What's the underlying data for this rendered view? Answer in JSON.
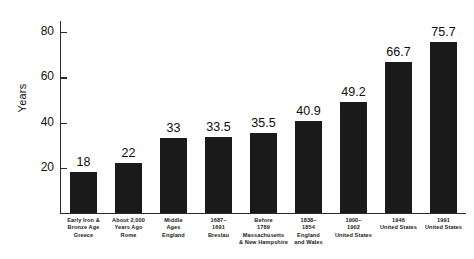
{
  "chart_data": {
    "type": "bar",
    "title": "",
    "subtitle": "",
    "xlabel": "",
    "ylabel": "Years",
    "ylim": [
      0,
      85
    ],
    "grid": false,
    "legend": "none",
    "y_ticks": [
      20,
      40,
      60,
      80
    ],
    "y_tick_labels": [
      "20",
      "40",
      "60",
      "80"
    ],
    "categories": [
      "Early Iron & Bronze Age Greece",
      "About 2,000 Years Ago Rome",
      "Middle Ages England",
      "1687–1691 Breslau",
      "Before 1789 Massachusetts & New Hampshire",
      "1838–1854 England and Wales",
      "1900–1902 United States",
      "1946 United States",
      "1991 United States"
    ],
    "category_lines": [
      [
        "Early Iron &",
        "Bronze Age",
        "Greece"
      ],
      [
        "About 2,000",
        "Years Ago",
        "Rome"
      ],
      [
        "Middle",
        "Ages",
        "England"
      ],
      [
        "1687–",
        "1691",
        "Breslau"
      ],
      [
        "Before",
        "1789",
        "Massachusetts",
        "& New Hampshire"
      ],
      [
        "1838–",
        "1854",
        "England",
        "and Wales"
      ],
      [
        "1900–",
        "1902",
        "United States"
      ],
      [
        "1946",
        "United States"
      ],
      [
        "1991",
        "United States"
      ]
    ],
    "values": [
      18,
      22,
      33,
      33.5,
      35.5,
      40.9,
      49.2,
      66.7,
      75.7
    ],
    "value_labels": [
      "18",
      "22",
      "33",
      "33.5",
      "35.5",
      "40.9",
      "49.2",
      "66.7",
      "75.7"
    ],
    "bar_color": "#1a1a1a",
    "axis_color": "#2b2b2b",
    "background_color": "#ffffff"
  }
}
